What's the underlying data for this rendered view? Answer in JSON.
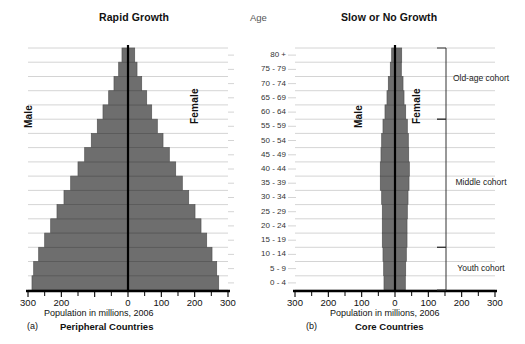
{
  "figure": {
    "age_header": "Age",
    "left_title": "Rapid Growth",
    "right_title": "Slow or No Growth",
    "bar_color": "#6e6e6e",
    "grid_color": "#c9c9c9",
    "axis_color": "#000000"
  },
  "panels": [
    {
      "id": "a",
      "letter": "(a)",
      "name": "Peripheral Countries",
      "title": "Rapid Growth",
      "xlabel": "Population in millions, 2006",
      "male_label": "Male",
      "female_label": "Female"
    },
    {
      "id": "b",
      "letter": "(b)",
      "name": "Core Countries",
      "title": "Slow or No Growth",
      "xlabel": "Population in millions, 2006",
      "male_label": "Male",
      "female_label": "Female"
    }
  ],
  "cohorts": [
    {
      "label": "Old-age cohort",
      "ages": "60 - 64 to 80 +"
    },
    {
      "label": "Middle cohort",
      "ages": "15 - 19 to 55 - 59"
    },
    {
      "label": "Youth cohort",
      "ages": "0 - 4 to 10 - 14"
    }
  ],
  "chart_data": {
    "type": "bar",
    "xlabel": "Population in millions, 2006",
    "ylabel": "Age",
    "xlim": [
      -300,
      300
    ],
    "xticks": [
      -300,
      -200,
      -100,
      0,
      100,
      200,
      300
    ],
    "xticklabels": [
      "300",
      "200",
      "100",
      "0",
      "100",
      "200",
      "300"
    ],
    "left_xticklabels": [
      "300",
      "200",
      "",
      "0",
      "100",
      "200",
      "300"
    ],
    "grid": true,
    "legend": "none",
    "categories": [
      "0 - 4",
      "5 - 9",
      "10 - 14",
      "15 - 19",
      "20 - 24",
      "25 - 29",
      "30 - 34",
      "35 - 39",
      "40 - 44",
      "45 - 49",
      "50 - 54",
      "55 - 59",
      "60 - 64",
      "65 - 69",
      "70 - 74",
      "75 - 79",
      "80 +"
    ],
    "charts": [
      {
        "panel": "(a)",
        "name": "Peripheral Countries",
        "subtitle": "Rapid Growth",
        "series": [
          {
            "name": "Male",
            "side": "left",
            "values": [
              288,
              283,
              268,
              250,
              232,
              213,
              192,
              172,
              150,
              130,
              110,
              92,
              75,
              58,
              42,
              28,
              18
            ]
          },
          {
            "name": "Female",
            "side": "right",
            "values": [
              272,
              266,
              252,
              236,
              219,
              201,
              182,
              163,
              143,
              124,
              105,
              88,
              71,
              56,
              41,
              27,
              20
            ]
          }
        ]
      },
      {
        "panel": "(b)",
        "name": "Core Countries",
        "subtitle": "Slow or No Growth",
        "series": [
          {
            "name": "Male",
            "side": "left",
            "values": [
              33,
              34,
              36,
              38,
              38,
              38,
              40,
              44,
              44,
              42,
              40,
              36,
              30,
              24,
              20,
              14,
              10
            ]
          },
          {
            "name": "Female",
            "side": "right",
            "values": [
              31,
              32,
              34,
              36,
              36,
              37,
              39,
              42,
              43,
              41,
              40,
              37,
              32,
              27,
              24,
              19,
              20
            ]
          }
        ]
      }
    ]
  }
}
